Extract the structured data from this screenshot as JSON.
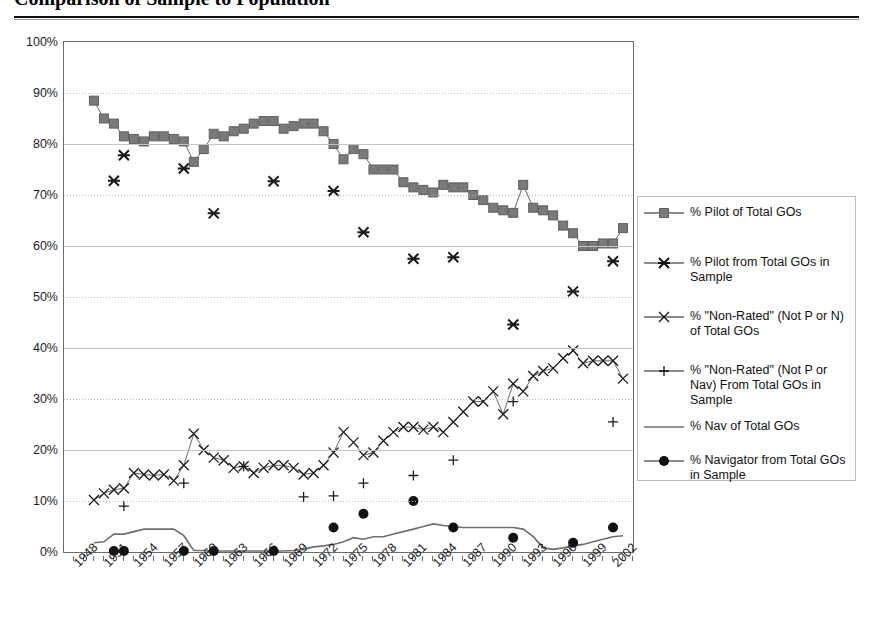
{
  "title": "Comparison of Sample to Population",
  "chart_data": {
    "type": "line",
    "title": "Comparison of Sample to Population",
    "xlabel": "",
    "ylabel": "",
    "xlim": [
      1947,
      2004
    ],
    "ylim": [
      0,
      100
    ],
    "grid": true,
    "legend_position": "right",
    "y_ticks": [
      "0%",
      "10%",
      "20%",
      "30%",
      "40%",
      "50%",
      "60%",
      "70%",
      "80%",
      "90%",
      "100%"
    ],
    "y_tick_values": [
      0,
      10,
      20,
      30,
      40,
      50,
      60,
      70,
      80,
      90,
      100
    ],
    "x_ticks": [
      "1948",
      "1951",
      "1954",
      "1957",
      "1960",
      "1963",
      "1966",
      "1969",
      "1972",
      "1975",
      "1978",
      "1981",
      "1984",
      "1987",
      "1990",
      "1993",
      "1996",
      "1999",
      "2002"
    ],
    "x_tick_values": [
      1948,
      1951,
      1954,
      1957,
      1960,
      1963,
      1966,
      1969,
      1972,
      1975,
      1978,
      1981,
      1984,
      1987,
      1990,
      1993,
      1996,
      1999,
      2002
    ],
    "series": [
      {
        "name": "% Pilot of Total GOs",
        "marker": "square",
        "color": "#7a7a7a",
        "x": [
          1950,
          1951,
          1952,
          1953,
          1954,
          1955,
          1956,
          1957,
          1958,
          1959,
          1960,
          1961,
          1962,
          1963,
          1964,
          1965,
          1966,
          1967,
          1968,
          1969,
          1970,
          1971,
          1972,
          1973,
          1974,
          1975,
          1976,
          1977,
          1978,
          1979,
          1980,
          1981,
          1982,
          1983,
          1984,
          1985,
          1986,
          1987,
          1988,
          1989,
          1990,
          1991,
          1992,
          1993,
          1994,
          1995,
          1996,
          1997,
          1998,
          1999,
          2000,
          2001,
          2002,
          2003
        ],
        "values": [
          88.5,
          85.0,
          84.0,
          81.5,
          81.0,
          80.5,
          81.5,
          81.5,
          81.0,
          80.5,
          76.5,
          79.0,
          82.0,
          81.5,
          82.5,
          83.0,
          84.0,
          84.5,
          84.5,
          83.0,
          83.5,
          84.0,
          84.0,
          82.5,
          80.0,
          77.0,
          79.0,
          78.0,
          75.0,
          75.0,
          75.0,
          72.5,
          71.5,
          71.0,
          70.5,
          72.0,
          71.5,
          71.5,
          70.0,
          69.0,
          67.5,
          67.0,
          66.5,
          72.0,
          67.5,
          67.0,
          66.0,
          64.0,
          62.5,
          60.0,
          60.0,
          60.5,
          60.5,
          63.5
        ]
      },
      {
        "name": "% Pilot from Total GOs in Sample",
        "marker": "asterisk",
        "color": "#1a1a1a",
        "x": [
          1952,
          1953,
          1959,
          1962,
          1968,
          1974,
          1977,
          1982,
          1986,
          1992,
          1998,
          2002
        ],
        "values": [
          72.8,
          77.8,
          75.2,
          66.4,
          72.7,
          70.8,
          62.7,
          57.5,
          57.8,
          44.6,
          51.1,
          57.0
        ]
      },
      {
        "name": "% \"Non-Rated\" (Not P or N) of Total GOs",
        "marker": "x",
        "color": "#1a1a1a",
        "x": [
          1950,
          1951,
          1952,
          1953,
          1954,
          1955,
          1956,
          1957,
          1958,
          1959,
          1960,
          1961,
          1962,
          1963,
          1964,
          1965,
          1966,
          1967,
          1968,
          1969,
          1970,
          1971,
          1972,
          1973,
          1974,
          1975,
          1976,
          1977,
          1978,
          1979,
          1980,
          1981,
          1982,
          1983,
          1984,
          1985,
          1986,
          1987,
          1988,
          1989,
          1990,
          1991,
          1992,
          1993,
          1994,
          1995,
          1996,
          1997,
          1998,
          1999,
          2000,
          2001,
          2002,
          2003
        ],
        "values": [
          10.2,
          11.5,
          12.2,
          12.5,
          15.5,
          15.2,
          15.0,
          15.2,
          14.0,
          17.0,
          23.2,
          20.0,
          18.5,
          18.0,
          16.5,
          16.8,
          15.5,
          16.5,
          17.0,
          17.0,
          16.5,
          15.2,
          15.5,
          17.0,
          19.5,
          23.5,
          21.5,
          19.0,
          19.5,
          21.8,
          23.5,
          24.5,
          24.5,
          24.0,
          24.5,
          23.5,
          25.5,
          27.5,
          29.5,
          29.5,
          31.5,
          27.0,
          33.0,
          31.5,
          34.5,
          35.5,
          36.0,
          38.0,
          39.5,
          37.0,
          37.5,
          37.5,
          37.5,
          34.0
        ]
      },
      {
        "name": "% \"Non-Rated\" (Not P or Nav) From Total GOs in Sample",
        "marker": "plus",
        "color": "#1a1a1a",
        "x": [
          1953,
          1959,
          1965,
          1971,
          1974,
          1977,
          1982,
          1986,
          1992,
          2002
        ],
        "values": [
          9.0,
          13.5,
          16.8,
          10.8,
          11.0,
          13.5,
          15.0,
          18.0,
          29.5,
          25.5
        ]
      },
      {
        "name": "% Nav of Total GOs",
        "marker": "none",
        "color": "#6f6f6f",
        "x": [
          1950,
          1951,
          1952,
          1953,
          1954,
          1955,
          1956,
          1957,
          1958,
          1959,
          1960,
          1961,
          1962,
          1963,
          1964,
          1965,
          1966,
          1967,
          1968,
          1969,
          1970,
          1971,
          1972,
          1973,
          1974,
          1975,
          1976,
          1977,
          1978,
          1979,
          1980,
          1981,
          1982,
          1983,
          1984,
          1985,
          1986,
          1987,
          1988,
          1989,
          1990,
          1991,
          1992,
          1993,
          1994,
          1995,
          1996,
          1997,
          1998,
          1999,
          2000,
          2001,
          2002,
          2003
        ],
        "values": [
          1.8,
          2.0,
          3.5,
          3.5,
          4.0,
          4.5,
          4.5,
          4.5,
          4.5,
          3.2,
          0.3,
          0.3,
          0.2,
          0.2,
          0.2,
          0.2,
          0.2,
          0.2,
          0.2,
          0.2,
          0.3,
          0.5,
          1.0,
          1.2,
          1.5,
          2.0,
          2.8,
          2.5,
          3.0,
          3.0,
          3.5,
          4.0,
          4.5,
          5.0,
          5.5,
          5.2,
          5.0,
          4.8,
          4.8,
          4.8,
          4.8,
          4.8,
          4.8,
          4.5,
          3.0,
          0.8,
          0.5,
          0.8,
          1.2,
          1.5,
          2.0,
          2.5,
          3.0,
          3.2
        ]
      },
      {
        "name": "% Navigator from Total GOs in Sample",
        "marker": "dot",
        "color": "#111111",
        "x": [
          1952,
          1953,
          1959,
          1962,
          1968,
          1974,
          1977,
          1982,
          1986,
          1992,
          1998,
          2002
        ],
        "values": [
          0.2,
          0.2,
          0.2,
          0.2,
          0.2,
          4.8,
          7.5,
          10.0,
          4.8,
          2.8,
          1.8,
          4.8
        ]
      }
    ]
  },
  "legend": {
    "items": [
      {
        "label": "% Pilot of Total GOs",
        "marker": "square"
      },
      {
        "label": "% Pilot from Total GOs in Sample",
        "marker": "asterisk"
      },
      {
        "label": "% \"Non-Rated\" (Not P or N) of Total GOs",
        "marker": "x"
      },
      {
        "label": "% \"Non-Rated\" (Not P or Nav) From Total GOs in Sample",
        "marker": "plus"
      },
      {
        "label": "% Nav of Total GOs",
        "marker": "none"
      },
      {
        "label": "% Navigator from Total GOs in Sample",
        "marker": "dot"
      }
    ]
  }
}
